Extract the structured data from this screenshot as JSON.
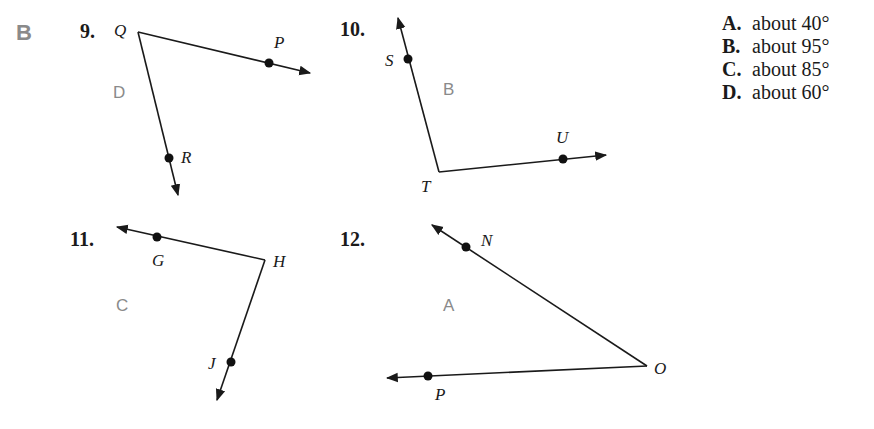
{
  "section_label": "B",
  "answer_choices": [
    {
      "letter": "A.",
      "text": "about 40°"
    },
    {
      "letter": "B.",
      "text": "about 95°"
    },
    {
      "letter": "C.",
      "text": "about 85°"
    },
    {
      "letter": "D.",
      "text": "about 60°"
    }
  ],
  "problems": [
    {
      "number": "9.",
      "vertex": "Q",
      "points": [
        "P",
        "R"
      ],
      "handwritten_answer": "D"
    },
    {
      "number": "10.",
      "vertex": "T",
      "points": [
        "S",
        "U"
      ],
      "handwritten_answer": "B"
    },
    {
      "number": "11.",
      "vertex": "H",
      "points": [
        "G",
        "J"
      ],
      "handwritten_answer": "C"
    },
    {
      "number": "12.",
      "vertex": "O",
      "points": [
        "N",
        "P"
      ],
      "handwritten_answer": "A"
    }
  ],
  "colors": {
    "ink": "#1a1a1a",
    "answer_gray": "#8a8a8a"
  }
}
